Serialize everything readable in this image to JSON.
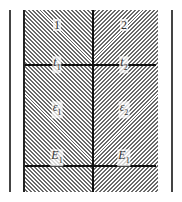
{
  "diagram": {
    "regions": [
      {
        "id": "1",
        "label": "1"
      },
      {
        "id": "2",
        "label": "2"
      }
    ],
    "interface_labels": [
      {
        "base": "t",
        "sub": "1"
      },
      {
        "base": "t",
        "sub": "2"
      }
    ],
    "strain_labels": [
      {
        "base": "ε",
        "sub": "1"
      },
      {
        "base": "ε",
        "sub": "2"
      }
    ],
    "modulus_labels": [
      {
        "base": "E",
        "sub": "1"
      },
      {
        "base": "E",
        "sub": "1"
      }
    ],
    "colors": {
      "line": "#111111",
      "hatch": "#6a6a6a",
      "background": "#ffffff"
    }
  }
}
